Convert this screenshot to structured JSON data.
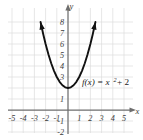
{
  "chart_data": {
    "type": "line",
    "title": "",
    "subtitle": "",
    "xlabel": "x",
    "ylabel": "y",
    "function_label": "f(x) = x",
    "function_exponent": "2",
    "function_tail": "+ 2",
    "equation": "f(x) = x^2 + 2",
    "grid": true,
    "legend_position": "none",
    "xlim": [
      -5.5,
      5.5
    ],
    "ylim": [
      -2.0,
      8.0
    ],
    "xticks": [
      "-5",
      "-4",
      "-3",
      "-2",
      "-1",
      "1",
      "2",
      "3",
      "4",
      "5"
    ],
    "yticks": [
      "8",
      "7",
      "6",
      "5",
      "4",
      "3",
      "1",
      "-1",
      "-2"
    ],
    "vertex": [
      0,
      2
    ],
    "series": [
      {
        "name": "f(x) = x^2 + 2",
        "color": "#111111",
        "arrow_start": true,
        "arrow_end": true,
        "x": [
          -2.45,
          -2.2,
          -2.0,
          -1.75,
          -1.5,
          -1.25,
          -1.0,
          -0.75,
          -0.5,
          -0.25,
          0,
          0.25,
          0.5,
          0.75,
          1.0,
          1.25,
          1.5,
          1.75,
          2.0,
          2.2,
          2.45
        ],
        "y": [
          8.0,
          6.84,
          6.0,
          5.06,
          4.25,
          3.56,
          3.0,
          2.56,
          2.25,
          2.06,
          2.0,
          2.06,
          2.25,
          2.56,
          3.0,
          3.56,
          4.25,
          5.06,
          6.0,
          6.84,
          8.0
        ]
      }
    ],
    "colors": {
      "grid": "#dcdcdc",
      "axis": "#6e6e6e",
      "curve": "#111111",
      "text": "#3b3b3b",
      "background": "#ffffff"
    }
  },
  "axes": {
    "x_axis_name": "x",
    "y_axis_name": "y"
  }
}
